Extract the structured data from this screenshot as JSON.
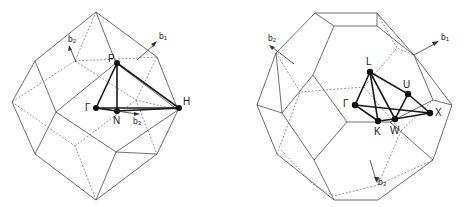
{
  "figures": [
    {
      "id": "bcc",
      "title": "",
      "description": "First Brillouin zone of the body-centered cubic lattice (rhombic dodecahedron) with irreducible wedge",
      "points": {
        "gamma": "Γ",
        "p": "P",
        "n": "N",
        "h": "H"
      },
      "vectors": {
        "b1": "b",
        "b1_sub": "1",
        "b2": "b",
        "b2_sub": "2",
        "b3": "b",
        "b3_sub": "3"
      }
    },
    {
      "id": "fcc",
      "title": "",
      "description": "First Brillouin zone of the face-centered cubic lattice (truncated octahedron) with irreducible wedge",
      "points": {
        "l": "L",
        "gamma": "Γ",
        "u": "U",
        "k": "K",
        "w": "W",
        "x": "X"
      },
      "vectors": {
        "b1": "b",
        "b1_sub": "1",
        "b2": "b",
        "b2_sub": "2",
        "b3": "b",
        "b3_sub": "3"
      }
    }
  ],
  "colors": {
    "line": "#4a4a4a",
    "path": "#1a1a1a",
    "point": "#111111",
    "background": "#ffffff"
  }
}
